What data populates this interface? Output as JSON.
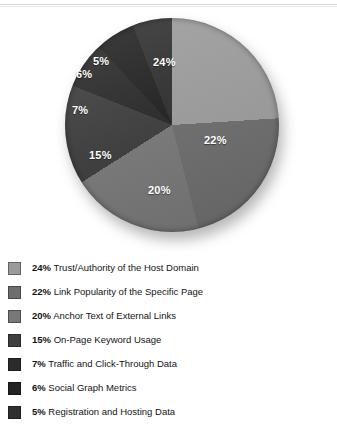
{
  "chart_data": {
    "type": "pie",
    "title": "",
    "subtitle": "",
    "xlabel": "",
    "ylabel": "",
    "legend_position": "bottom-left",
    "grid": false,
    "units": "percent",
    "total": 99,
    "categories": [
      "Trust/Authority of the Host Domain",
      "Link Popularity of the Specific Page",
      "Anchor Text of External Links",
      "On-Page Keyword Usage",
      "Traffic and Click-Through Data",
      "Social Graph Metrics",
      "Registration and Hosting Data"
    ],
    "values": [
      24,
      22,
      20,
      15,
      7,
      6,
      5
    ],
    "value_labels": [
      "24%",
      "22%",
      "20%",
      "15%",
      "7%",
      "6%",
      "5%"
    ],
    "colors": [
      "#9a9a9a",
      "#6e6e6e",
      "#787878",
      "#3f3f3f",
      "#2b2b2b",
      "#232323",
      "#303030"
    ],
    "slices": [
      {
        "label": "24%",
        "name": "Trust/Authority of the Host Domain",
        "value": 24,
        "color": "#9a9a9a",
        "start_deg": 0,
        "end_deg": 86.4
      },
      {
        "label": "22%",
        "name": "Link Popularity of the Specific Page",
        "value": 22,
        "color": "#6e6e6e",
        "start_deg": 86.4,
        "end_deg": 165.6
      },
      {
        "label": "20%",
        "name": "Anchor Text of External Links",
        "value": 20,
        "color": "#787878",
        "start_deg": 165.6,
        "end_deg": 237.6
      },
      {
        "label": "15%",
        "name": "On-Page Keyword Usage",
        "value": 15,
        "color": "#3f3f3f",
        "start_deg": 237.6,
        "end_deg": 291.6
      },
      {
        "label": "7%",
        "name": "Traffic and Click-Through Data",
        "value": 7,
        "color": "#2b2b2b",
        "start_deg": 291.6,
        "end_deg": 316.8
      },
      {
        "label": "6%",
        "name": "Social Graph Metrics",
        "value": 6,
        "color": "#232323",
        "start_deg": 316.8,
        "end_deg": 338.4
      },
      {
        "label": "5%",
        "name": "Registration and Hosting Data",
        "value": 5,
        "color": "#303030",
        "start_deg": 338.4,
        "end_deg": 360
      }
    ]
  },
  "legend": {
    "items": [
      {
        "pct": "24%",
        "name": "Trust/Authority of the Host Domain",
        "color": "#9a9a9a"
      },
      {
        "pct": "22%",
        "name": "Link Popularity of the Specific Page",
        "color": "#6e6e6e"
      },
      {
        "pct": "20%",
        "name": "Anchor Text of External Links",
        "color": "#787878"
      },
      {
        "pct": "15%",
        "name": "On-Page Keyword Usage",
        "color": "#3f3f3f"
      },
      {
        "pct": "7%",
        "name": "Traffic and Click-Through Data",
        "color": "#2b2b2b"
      },
      {
        "pct": "6%",
        "name": "Social Graph Metrics",
        "color": "#232323"
      },
      {
        "pct": "5%",
        "name": "Registration and Hosting Data",
        "color": "#303030"
      }
    ]
  }
}
